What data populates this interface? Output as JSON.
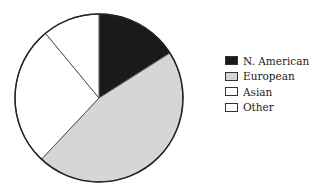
{
  "chart_data": {
    "type": "pie",
    "title": "",
    "categories": [
      "N. American",
      "European",
      "Asian",
      "Other"
    ],
    "values": [
      16,
      46,
      27,
      11
    ],
    "colors": [
      "#1a1a1a",
      "#d6d6d6",
      "#ffffff",
      "#ffffff"
    ],
    "start_angle_deg": 0,
    "direction": "clockwise",
    "legend_position": "right"
  },
  "legend": {
    "items": [
      {
        "label": "N. American",
        "color": "#1a1a1a"
      },
      {
        "label": "European",
        "color": "#d6d6d6"
      },
      {
        "label": "Asian",
        "color": "#ffffff"
      },
      {
        "label": "Other",
        "color": "#ffffff"
      }
    ]
  }
}
